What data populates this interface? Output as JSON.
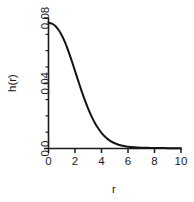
{
  "chart_data": {
    "type": "line",
    "title": "",
    "subtitle": "",
    "xlabel": "r",
    "ylabel": "h(r)",
    "xlim": [
      0,
      10
    ],
    "ylim": [
      0.0,
      0.08
    ],
    "grid": false,
    "legend": false,
    "legend_position": "none",
    "xticks": [
      "0",
      "2",
      "4",
      "6",
      "8",
      "10"
    ],
    "xtick_values": [
      0,
      2,
      4,
      6,
      8,
      10
    ],
    "yticks": [
      "0.0",
      "0.04",
      "0.08"
    ],
    "ytick_values": [
      0.0,
      0.04,
      0.08
    ],
    "y_minor_tick_values": [
      0.01,
      0.02,
      0.03,
      0.05,
      0.06,
      0.07
    ],
    "series": [
      {
        "name": "h(r)",
        "color": "#141414",
        "x": [
          0.0,
          0.25,
          0.5,
          0.75,
          1.0,
          1.25,
          1.5,
          1.75,
          2.0,
          2.25,
          2.5,
          2.75,
          3.0,
          3.25,
          3.5,
          3.75,
          4.0,
          4.25,
          4.5,
          4.75,
          5.0,
          5.5,
          6.0,
          6.5,
          7.0,
          7.5,
          8.0,
          8.5,
          9.0,
          9.5,
          10.0
        ],
        "y": [
          0.077,
          0.0766,
          0.0752,
          0.0728,
          0.0694,
          0.065,
          0.0597,
          0.0538,
          0.0476,
          0.0413,
          0.0352,
          0.0295,
          0.0243,
          0.0197,
          0.0157,
          0.0124,
          0.0096,
          0.0074,
          0.0056,
          0.0042,
          0.0032,
          0.0018,
          0.0011,
          0.0007,
          0.0005,
          0.0004,
          0.0003,
          0.0003,
          0.0002,
          0.0002,
          0.0002
        ]
      }
    ]
  },
  "figure": {
    "background_color": "#ffffff",
    "axis_color": "#1c1c1c",
    "text_color": "#1a1a1a"
  }
}
